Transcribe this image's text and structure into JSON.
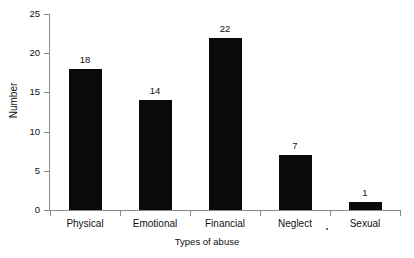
{
  "chart_data": {
    "type": "bar",
    "title": "",
    "xlabel": "Types of abuse",
    "ylabel": "Number",
    "categories": [
      "Physical",
      "Emotional",
      "Financial",
      "Neglect",
      "Sexual"
    ],
    "values": [
      18,
      14,
      22,
      7,
      1
    ],
    "value_labels": [
      "18",
      "14",
      "22",
      "7",
      "1"
    ],
    "ylim": [
      0,
      25
    ],
    "y_ticks": [
      0,
      5,
      10,
      15,
      20,
      25
    ],
    "y_tick_labels": [
      "0",
      "5",
      "10",
      "15",
      "20",
      "25"
    ],
    "grid": false,
    "legend": false,
    "bar_color": "#0a0a0a",
    "axis_color": "#8a8a8a",
    "background": "#ffffff"
  }
}
